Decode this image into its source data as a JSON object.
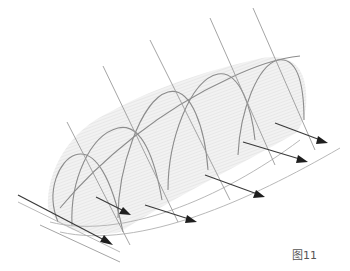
{
  "figure": {
    "label": "图11"
  },
  "colors": {
    "background": "#ffffff",
    "membrane_fill": "#eeeeee",
    "hatch": "#dcdcdc",
    "arch_line": "#8c8c8c",
    "pole_line": "#9a9a9a",
    "arrow": "#1e1e1e",
    "label": "#555555"
  },
  "structure": {
    "arch_count": 5,
    "pole_count": 6,
    "arrow_count": 6
  },
  "arrows": [
    {
      "from": [
        18,
        195
      ],
      "to": [
        113,
        245
      ]
    },
    {
      "from": [
        96,
        197
      ],
      "to": [
        131,
        215
      ]
    },
    {
      "from": [
        145,
        205
      ],
      "to": [
        197,
        222
      ]
    },
    {
      "from": [
        205,
        175
      ],
      "to": [
        265,
        197
      ]
    },
    {
      "from": [
        243,
        142
      ],
      "to": [
        308,
        162
      ]
    },
    {
      "from": [
        275,
        123
      ],
      "to": [
        328,
        143
      ]
    }
  ]
}
